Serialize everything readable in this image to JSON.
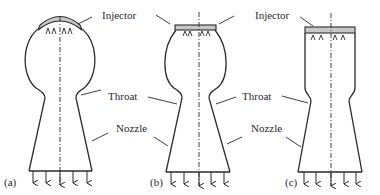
{
  "figure": {
    "colors": {
      "stroke": "#2a2a2a",
      "injector_fill": "#c8c8c8",
      "background": "#ffffff"
    },
    "panels": [
      {
        "id": "a",
        "tag": "(a)",
        "shape": "spherical chamber",
        "labels": {
          "injector": "Injector",
          "throat": "Throat",
          "nozzle": "Nozzle"
        }
      },
      {
        "id": "b",
        "tag": "(b)",
        "shape": "near-spherical / bulged cylindrical chamber",
        "labels": {
          "injector": "Injector",
          "throat": "Throat",
          "nozzle": "Nozzle"
        }
      },
      {
        "id": "c",
        "tag": "(c)",
        "shape": "cylindrical chamber",
        "labels": {
          "injector": "Injector",
          "throat": "Throat",
          "nozzle": "Nozzle"
        }
      }
    ]
  }
}
